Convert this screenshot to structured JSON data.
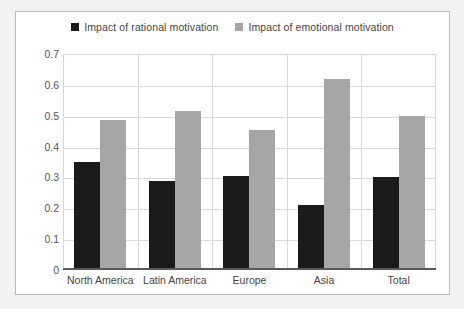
{
  "chart_data": {
    "type": "bar",
    "title": "",
    "xlabel": "",
    "ylabel": "",
    "ylim": [
      0,
      0.7
    ],
    "ytick_labels": [
      "0.7",
      "0.6",
      "0.5",
      "0.4",
      "0.3",
      "0.2",
      "0.1",
      "0"
    ],
    "ytick_values": [
      0.7,
      0.6,
      0.5,
      0.4,
      0.3,
      0.2,
      0.1,
      0
    ],
    "grid": "horizontal-and-vertical",
    "legend_position": "top-center",
    "categories": [
      "North America",
      "Latin America",
      "Europe",
      "Asia",
      "Total"
    ],
    "series": [
      {
        "name": "Impact of rational motivation",
        "color": "#1a1a1a",
        "values": [
          0.35,
          0.29,
          0.305,
          0.21,
          0.3
        ]
      },
      {
        "name": "Impact of emotional motivation",
        "color": "#a6a6a6",
        "values": [
          0.485,
          0.515,
          0.455,
          0.62,
          0.5
        ]
      }
    ]
  },
  "colors": {
    "page_background": "#f2f2f2",
    "chart_background": "#ffffff",
    "frame_border": "#b9b9b9",
    "gridline": "#d9d9d9",
    "axis_line": "#5a5a5a",
    "text": "#444444",
    "series_rational": "#1a1a1a",
    "series_emotional": "#a6a6a6"
  }
}
